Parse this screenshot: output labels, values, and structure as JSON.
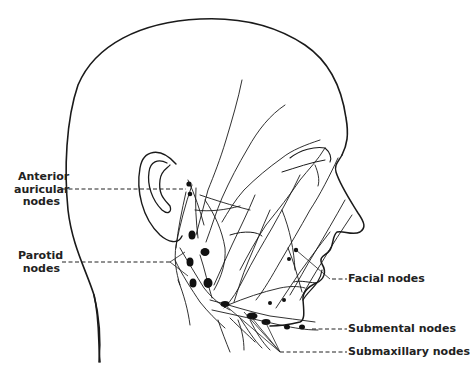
{
  "figure": {
    "labels": {
      "anterior_auricular": [
        "Anterior",
        "auricular",
        "nodes"
      ],
      "parotid": [
        "Parotid",
        "nodes"
      ],
      "facial": "Facial nodes",
      "submental": "Submental nodes",
      "submaxillary": "Submaxillary nodes"
    },
    "colors": {
      "ink": "#1a1a1a",
      "background": "#ffffff"
    }
  }
}
